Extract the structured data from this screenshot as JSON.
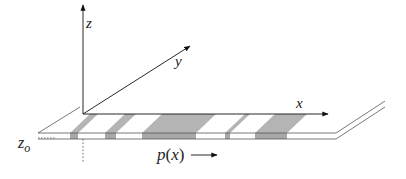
{
  "diagram": {
    "axes": {
      "z_label": "z",
      "y_label": "y",
      "x_label": "x"
    },
    "plate": {
      "height_label_main": "z",
      "height_label_sub": "o",
      "stripe_fill": "#b4b4b4",
      "line_color": "#555555",
      "stripes_front": [
        [
          70,
          78
        ],
        [
          105,
          116
        ],
        [
          142,
          196
        ],
        [
          225,
          230
        ],
        [
          255,
          287
        ]
      ]
    },
    "pattern_label": {
      "text_p": "p",
      "text_open": "(",
      "text_x": "x",
      "text_close": ")"
    }
  }
}
